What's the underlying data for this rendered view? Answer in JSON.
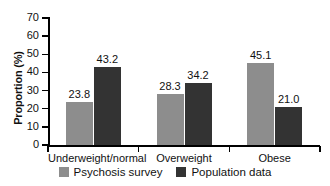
{
  "chart_data": {
    "type": "bar",
    "title": "",
    "xlabel": "",
    "ylabel": "Proportion (%)",
    "categories": [
      "Underweight/normal",
      "Overweight",
      "Obese"
    ],
    "series": [
      {
        "name": "Psychosis survey",
        "color": "#8d8d8d",
        "values": [
          23.8,
          28.3,
          45.1
        ],
        "labels": [
          "23.8",
          "28.3",
          "45.1"
        ]
      },
      {
        "name": "Population data",
        "color": "#333333",
        "values": [
          43.2,
          34.2,
          21.0
        ],
        "labels": [
          "43.2",
          "34.2",
          "21.0"
        ]
      }
    ],
    "ylim": [
      0,
      70
    ],
    "yticks": [
      0,
      10,
      20,
      30,
      40,
      50,
      60,
      70
    ],
    "ytick_labels": [
      "0",
      "10",
      "20",
      "30",
      "40",
      "50",
      "60",
      "70"
    ],
    "grid": false,
    "legend_position": "bottom",
    "value_labels_shown": true
  }
}
